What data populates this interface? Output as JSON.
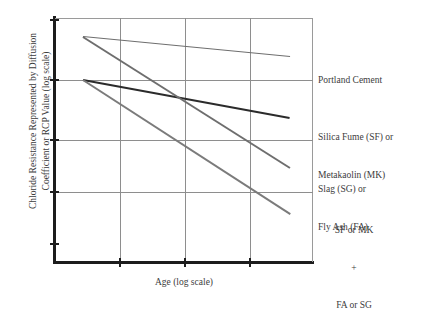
{
  "chart_data": {
    "type": "line",
    "title": "",
    "xlabel": "Age (log scale)",
    "ylabel": "Chloride Resistance Represented by Diffusion Coefficient or RCP Value (log scale)",
    "ylabel_line1": "Chloride Resistance Represented by Diffusion",
    "ylabel_line2": "Coefficient or RCP Value (log scale)",
    "grid": true,
    "axes_have_tick_labels": false,
    "x_gridlines": [
      120,
      185,
      250
    ],
    "y_gridlines": [
      80,
      140,
      192
    ],
    "legend_position": "right-inline",
    "schematic": true,
    "series": [
      {
        "name": "Portland Cement",
        "label_lines": [
          "Portland Cement"
        ],
        "color": "#6e6e6e",
        "width": 1.4,
        "x": [
          0.12,
          1.0
        ],
        "y": [
          0.922,
          0.84
        ],
        "px": [
          83,
          290
        ],
        "py": [
          37,
          57
        ]
      },
      {
        "name": "Silica Fume (SF) or Metakaolin (MK)",
        "label_lines": [
          "Silica Fume (SF) or",
          "Metakaolin (MK)"
        ],
        "color": "#2b2b2b",
        "width": 2.1,
        "x": [
          0.12,
          1.0
        ],
        "y": [
          0.746,
          0.59
        ],
        "px": [
          83,
          80
        ],
        "py": [
          80,
          118
        ]
      },
      {
        "name": "Slag (SG) or Fly Ash (FA)",
        "label_lines": [
          "Slag (SG) or",
          "Fly Ash (FA)"
        ],
        "color": "#6e6e6e",
        "width": 1.8,
        "x": [
          0.12,
          1.0
        ],
        "y": [
          0.922,
          0.385
        ],
        "px": [
          83,
          290
        ],
        "py": [
          37,
          168
        ]
      },
      {
        "name": "SF or MK + FA or SG",
        "label_lines": [
          "SF or MK",
          "+",
          "FA or SG"
        ],
        "color": "#7b7b7b",
        "width": 1.8,
        "x": [
          0.12,
          1.0
        ],
        "y": [
          0.746,
          0.197
        ],
        "px": [
          83,
          290
        ],
        "py": [
          80,
          214
        ]
      }
    ]
  },
  "labels": {
    "portland_cement": "Portland Cement",
    "silica_fume_line1": "Silica Fume (SF) or",
    "silica_fume_line2": "Metakaolin (MK)",
    "slag_line1": "Slag (SG) or",
    "slag_line2": "Fly Ash (FA)",
    "combo_line1": "SF or MK",
    "combo_line2": "+",
    "combo_line3": "FA or SG",
    "y_axis_line1": "Chloride Resistance Represented by Diffusion",
    "y_axis_line2": "Coefficient or RCP Value (log scale)",
    "x_axis": "Age (log scale)"
  },
  "colors": {
    "axis": "#1d1d1d",
    "grid": "#8e8e8e",
    "frame": "#9a9a9a",
    "text": "#3c3c3c",
    "line_gray": "#6e6e6e",
    "line_dark": "#2b2b2b",
    "background": "#ffffff"
  }
}
